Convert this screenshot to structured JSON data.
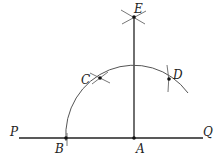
{
  "diagram": {
    "type": "geometric construction",
    "labels": {
      "P": "P",
      "Q": "Q",
      "A": "A",
      "B": "B",
      "C": "C",
      "D": "D",
      "E": "E"
    },
    "points": {
      "A": [
        134,
        138
      ],
      "B": [
        66,
        138
      ],
      "C": [
        100,
        78
      ],
      "D": [
        169,
        79
      ],
      "E": [
        134,
        17
      ]
    },
    "colors": {
      "line": "#222222",
      "arc": "#555555",
      "marks": "#666666"
    }
  }
}
